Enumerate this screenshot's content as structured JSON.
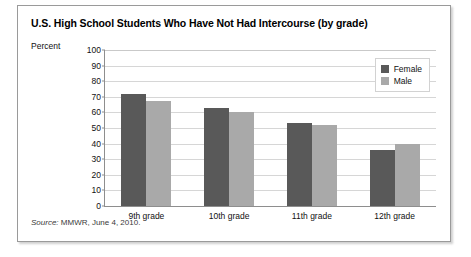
{
  "title": "U.S. High School Students Who Have Not Had Intercourse (by grade)",
  "source": {
    "prefix": "Source:",
    "text": " MMWR, June 4, 2010."
  },
  "legend": {
    "female_label": "Female",
    "male_label": "Male"
  },
  "colors": {
    "female": "#595959",
    "male": "#a9a9a9",
    "grid": "#d6d6d6",
    "axis": "#8e8e8e",
    "border": "#9a9a9a"
  },
  "chart_data": {
    "type": "bar",
    "title": "U.S. High School Students Who Have Not Had Intercourse (by grade)",
    "categories": [
      "9th grade",
      "10th grade",
      "11th grade",
      "12th grade"
    ],
    "series": [
      {
        "name": "Female",
        "values": [
          72,
          63,
          53,
          36
        ]
      },
      {
        "name": "Male",
        "values": [
          67,
          60,
          52,
          40
        ]
      }
    ],
    "xlabel": "",
    "ylabel": "Percent",
    "ylim": [
      0,
      100
    ],
    "yticks": [
      0,
      10,
      20,
      30,
      40,
      50,
      60,
      70,
      80,
      90,
      100
    ],
    "grid": true,
    "legend_position": "top-right"
  }
}
